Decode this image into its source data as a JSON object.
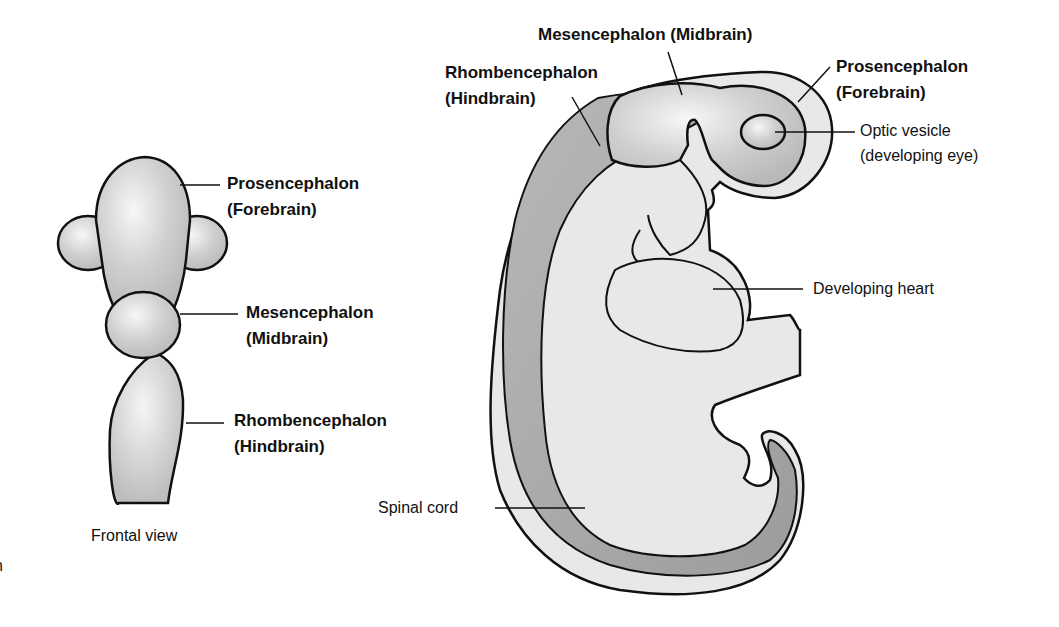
{
  "frontal_view": {
    "caption": "Frontal view",
    "labels": {
      "prosencephalon": {
        "name": "Prosencephalon",
        "common": "(Forebrain)"
      },
      "mesencephalon": {
        "name": "Mesencephalon",
        "common": "(Midbrain)"
      },
      "rhombencephalon": {
        "name": "Rhombencephalon",
        "common": "(Hindbrain)"
      }
    }
  },
  "lateral_view": {
    "labels": {
      "mesencephalon": "Mesencephalon (Midbrain)",
      "rhombencephalon": {
        "name": "Rhombencephalon",
        "common": "(Hindbrain)"
      },
      "prosencephalon": {
        "name": "Prosencephalon",
        "common": "(Forebrain)"
      },
      "optic_vesicle": {
        "name": "Optic vesicle",
        "note": "(developing eye)"
      },
      "developing_heart": "Developing heart",
      "spinal_cord": "Spinal cord"
    }
  },
  "edge_fragment": "n",
  "colors": {
    "background": "#ffffff",
    "outline": "#111111",
    "light_fill": "#e6e6e6",
    "mid_fill": "#c8c8c8",
    "neural_tube_fill": "#a9a9a9"
  }
}
